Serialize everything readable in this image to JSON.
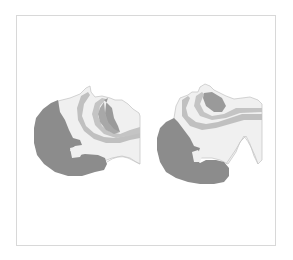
{
  "figure": {
    "type": "medical-illustration",
    "panels": [
      {
        "id": "left",
        "description": "head tilted back, side profile, airway open"
      },
      {
        "id": "right",
        "description": "head tilted back further, side profile, airway"
      }
    ],
    "colors": {
      "hair": "#8c8c8c",
      "skin": "#efefef",
      "outline": "#c8c8c8",
      "airway_light": "#bdbdbd",
      "tongue": "#9a9a9a",
      "background": "#ffffff",
      "frame": "#d8d8d8"
    }
  }
}
